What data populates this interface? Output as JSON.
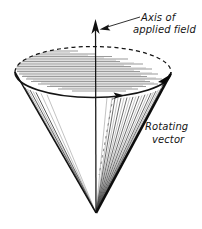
{
  "figure": {
    "background_color": "#ffffff",
    "ink_color": "#141414",
    "labels": {
      "axis_line1": "Axis of",
      "axis_line2": "applied field",
      "vector_line1": "Rotating",
      "vector_line2": "vector"
    },
    "geometry": {
      "apex_x": 96,
      "apex_y": 213,
      "ellipse_cx": 93,
      "ellipse_cy": 72,
      "ellipse_rx": 79,
      "ellipse_ry": 26,
      "axis_top_y": 20,
      "axis_bottom_y": 213,
      "vector_tip_x": 170,
      "vector_tip_y": 78,
      "rotation_arrow_x": 120,
      "rotation_arrow_y": 96
    },
    "icons": {
      "axis_arrow": "up-arrow-icon",
      "vector_arrow": "vector-arrow-icon",
      "rotation_arrow": "rotation-direction-arrow-icon",
      "leader_arrow": "leader-arrow-icon"
    }
  }
}
